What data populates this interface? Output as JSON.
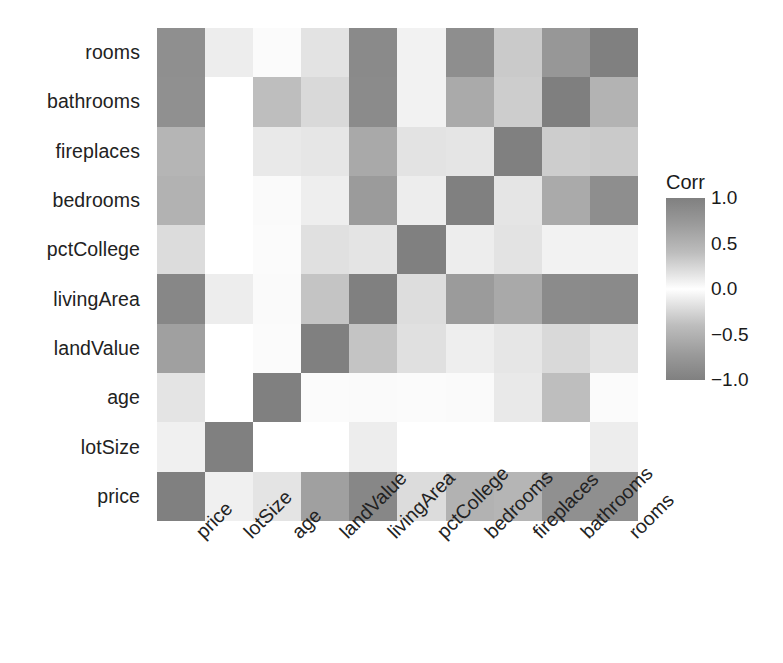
{
  "chart_data": {
    "type": "heatmap",
    "title": "",
    "xlabel": "",
    "ylabel": "",
    "legend_title": "Corr",
    "legend_position": "right",
    "grid": false,
    "zlim": [
      -1.0,
      1.0
    ],
    "legend_ticks": [
      "1.0",
      "0.5",
      "0.0",
      "-0.5",
      "-1.0"
    ],
    "legend_tick_values": [
      1.0,
      0.5,
      0.0,
      -0.5,
      -1.0
    ],
    "x_categories": [
      "price",
      "lotSize",
      "age",
      "landValue",
      "livingArea",
      "pctCollege",
      "bedrooms",
      "fireplaces",
      "bathrooms",
      "rooms"
    ],
    "y_categories": [
      "rooms",
      "bathrooms",
      "fireplaces",
      "bedrooms",
      "pctCollege",
      "livingArea",
      "landValue",
      "age",
      "lotSize",
      "price"
    ],
    "matrix": [
      {
        "row": "rooms",
        "values": [
          0.53,
          0.14,
          -0.08,
          0.12,
          0.73,
          0.16,
          0.67,
          0.33,
          0.52,
          1.0
        ]
      },
      {
        "row": "bathrooms",
        "values": [
          0.6,
          0.17,
          -0.36,
          0.21,
          0.72,
          0.18,
          0.46,
          0.3,
          1.0,
          0.52
        ]
      },
      {
        "row": "fireplaces",
        "values": [
          0.38,
          0.09,
          -0.17,
          0.21,
          0.47,
          0.25,
          0.18,
          1.0,
          0.3,
          0.33
        ]
      },
      {
        "row": "bedrooms",
        "values": [
          0.4,
          0.11,
          -0.03,
          0.12,
          0.66,
          0.16,
          1.0,
          0.18,
          0.46,
          0.67
        ]
      },
      {
        "row": "pctCollege",
        "values": [
          0.2,
          0.06,
          -0.03,
          0.23,
          0.21,
          1.0,
          0.16,
          0.25,
          0.18,
          0.16
        ]
      },
      {
        "row": "livingArea",
        "values": [
          0.71,
          0.16,
          -0.17,
          0.42,
          1.0,
          0.21,
          0.66,
          0.47,
          0.72,
          0.73
        ]
      },
      {
        "row": "landValue",
        "values": [
          0.58,
          0.06,
          -0.02,
          1.0,
          0.42,
          0.23,
          0.12,
          0.21,
          0.21,
          0.12
        ]
      },
      {
        "row": "age",
        "values": [
          -0.19,
          0.02,
          1.0,
          -0.02,
          -0.17,
          -0.03,
          -0.03,
          -0.17,
          -0.36,
          -0.08
        ]
      },
      {
        "row": "lotSize",
        "values": [
          0.16,
          1.0,
          0.02,
          0.06,
          0.16,
          0.06,
          0.11,
          0.09,
          0.17,
          0.14
        ]
      },
      {
        "row": "price",
        "values": [
          1.0,
          0.16,
          -0.19,
          0.58,
          0.71,
          0.2,
          0.4,
          0.38,
          0.6,
          0.53
        ]
      }
    ],
    "cell_shades": [
      [
        "#8f8f8f",
        "#ededed",
        "#fbfbfb",
        "#e3e3e3",
        "#8a8a8a",
        "#f2f2f2",
        "#8e8e8e",
        "#cacaca",
        "#979797",
        "#808080"
      ],
      [
        "#909090",
        "#ffffff",
        "#bebebe",
        "#d9d9d9",
        "#8b8b8b",
        "#f2f2f2",
        "#aaaaaa",
        "#cdcdcd",
        "#7f7f7f",
        "#b3b3b3"
      ],
      [
        "#b5b5b5",
        "#ffffff",
        "#e9e9e9",
        "#e6e6e6",
        "#a9a9a9",
        "#e3e3e3",
        "#e5e5e5",
        "#808080",
        "#cdcdcd",
        "#cacaca"
      ],
      [
        "#b2b2b2",
        "#ffffff",
        "#fafafa",
        "#eeeeee",
        "#9b9b9b",
        "#ededed",
        "#808080",
        "#e5e5e5",
        "#aaaaaa",
        "#8e8e8e"
      ],
      [
        "#dcdcdc",
        "#ffffff",
        "#fbfbfb",
        "#e0e0e0",
        "#ddddddd",
        "#808080",
        "#ededed",
        "#e3e3e3",
        "#f2f2f2",
        "#f2f2f2"
      ],
      [
        "#878787",
        "#ededed",
        "#fafafa",
        "#c4c4c4",
        "#808080",
        "#dddddd",
        "#9b9b9b",
        "#a9a9a9",
        "#8b8b8b",
        "#8a8a8a"
      ],
      [
        "#a0a0a0",
        "#ffffff",
        "#fbfbfb",
        "#808080",
        "#c4c4c4",
        "#e0e0e0",
        "#eeeeee",
        "#e6e6e6",
        "#d9d9d9",
        "#e3e3e3"
      ],
      [
        "#e4e4e4",
        "#ffffff",
        "#808080",
        "#fbfbfb",
        "#fafafa",
        "#fbfbfb",
        "#fafafa",
        "#e9e9e9",
        "#bebebe",
        "#fbfbfb"
      ],
      [
        "#f0f0f0",
        "#808080",
        "#ffffff",
        "#ffffff",
        "#ededed",
        "#ffffff",
        "#ffffff",
        "#ffffff",
        "#ffffff",
        "#ededed"
      ],
      [
        "#808080",
        "#f0f0f0",
        "#e4e4e4",
        "#a0a0a0",
        "#878787",
        "#dcdcdc",
        "#b2b2b2",
        "#b5b5b5",
        "#909090",
        "#8f8f8f"
      ]
    ],
    "colors": {
      "high": "#808080",
      "mid": "#ffffff",
      "low": "#808080",
      "panel_background": "#ffffff",
      "text": "#1a1a1a"
    }
  }
}
